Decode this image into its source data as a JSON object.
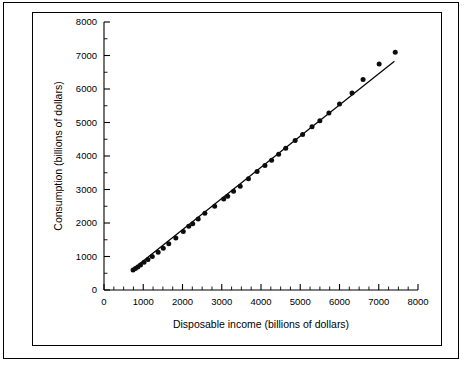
{
  "chart_data": {
    "type": "scatter",
    "title": "",
    "xlabel": "Disposable income (billions of dollars)",
    "ylabel": "Consumption (billions of dollars)",
    "xlim": [
      0,
      8000
    ],
    "ylim": [
      0,
      8000
    ],
    "x_ticks": [
      0,
      1000,
      2000,
      3000,
      4000,
      5000,
      6000,
      7000,
      8000
    ],
    "y_ticks": [
      0,
      1000,
      2000,
      3000,
      4000,
      5000,
      6000,
      7000,
      8000
    ],
    "x_tick_labels": [
      "0",
      "1000",
      "2000",
      "3000",
      "4000",
      "5000",
      "6000",
      "7000",
      "8000"
    ],
    "y_tick_labels": [
      "0",
      "1000",
      "2000",
      "3000",
      "4000",
      "5000",
      "6000",
      "7000",
      "8000"
    ],
    "x_minor_tick_step": 250,
    "y_minor_tick_step": 500,
    "grid": false,
    "legend": false,
    "legend_position": "none",
    "marker_color": "#0d0d0d",
    "line_color": "#000000",
    "series": [
      {
        "name": "Consumption vs disposable income",
        "marker": "filled-circle",
        "points": [
          [
            740,
            600
          ],
          [
            800,
            640
          ],
          [
            860,
            690
          ],
          [
            930,
            750
          ],
          [
            1020,
            830
          ],
          [
            1120,
            910
          ],
          [
            1230,
            1000
          ],
          [
            1380,
            1130
          ],
          [
            1510,
            1250
          ],
          [
            1650,
            1380
          ],
          [
            1830,
            1550
          ],
          [
            2020,
            1750
          ],
          [
            2160,
            1900
          ],
          [
            2260,
            1980
          ],
          [
            2400,
            2120
          ],
          [
            2570,
            2290
          ],
          [
            2820,
            2500
          ],
          [
            3050,
            2720
          ],
          [
            3150,
            2800
          ],
          [
            3300,
            2950
          ],
          [
            3470,
            3100
          ],
          [
            3680,
            3320
          ],
          [
            3900,
            3540
          ],
          [
            4100,
            3720
          ],
          [
            4270,
            3870
          ],
          [
            4450,
            4050
          ],
          [
            4630,
            4230
          ],
          [
            4870,
            4460
          ],
          [
            5060,
            4640
          ],
          [
            5300,
            4870
          ],
          [
            5500,
            5050
          ],
          [
            5730,
            5280
          ],
          [
            6000,
            5550
          ],
          [
            6320,
            5880
          ],
          [
            6600,
            6280
          ],
          [
            7010,
            6750
          ],
          [
            7420,
            7100
          ]
        ]
      }
    ],
    "fit_line": {
      "name": "regression line",
      "x_start": 700,
      "y_start": 590,
      "x_end": 7400,
      "y_end": 6830
    }
  }
}
